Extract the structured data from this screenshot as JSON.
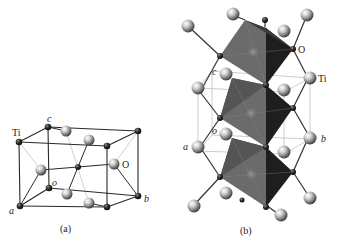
{
  "figure": {
    "panels": [
      {
        "id": "a",
        "caption": "(a)",
        "description": "Rutile TiO2 unit cell (tetragonal)",
        "labels": {
          "ti": "Ti",
          "o": "O",
          "axis_a": "a",
          "axis_b": "b",
          "axis_c": "c",
          "origin": "o"
        }
      },
      {
        "id": "b",
        "caption": "(b)",
        "description": "Chains of edge-sharing TiO6 octahedra along c",
        "labels": {
          "ti": "Ti",
          "o": "O",
          "axis_a": "a",
          "axis_b": "b",
          "axis_c": "c",
          "origin": "o"
        }
      }
    ]
  },
  "colors": {
    "bond": "#333333",
    "thin_line": "#bbbbbb",
    "small_atom": "#1a1a1a",
    "big_atom": "#9a9a9a",
    "octa_left": "#666666",
    "octa_right": "#1c1c1c",
    "octa_top": "#7a7a7a"
  }
}
